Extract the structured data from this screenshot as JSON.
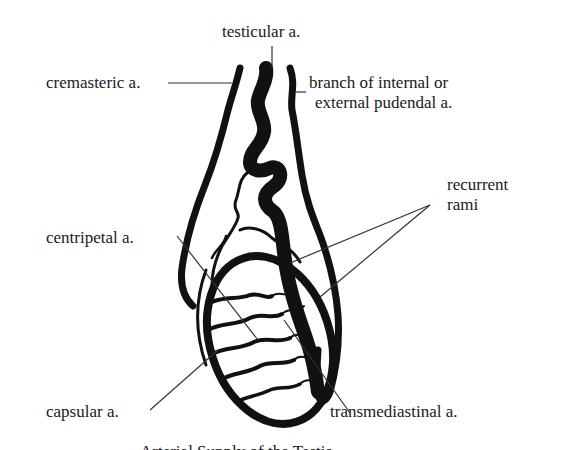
{
  "diagram": {
    "subject": "Arterial supply of the testis",
    "labels": {
      "testicular": "testicular a.",
      "cremasteric": "cremasteric a.",
      "pudendal_line1": "branch of internal or",
      "pudendal_line2": "external pudendal a.",
      "recurrent_line1": "recurrent",
      "recurrent_line2": "rami",
      "centripetal": "centripetal a.",
      "capsular": "capsular a.",
      "transmediastinal": "transmediastinal a."
    },
    "caption_cut": "Arterial Supply of the Testis"
  },
  "colors": {
    "ink": "#111111",
    "leader": "#333333",
    "background": "#ffffff"
  }
}
